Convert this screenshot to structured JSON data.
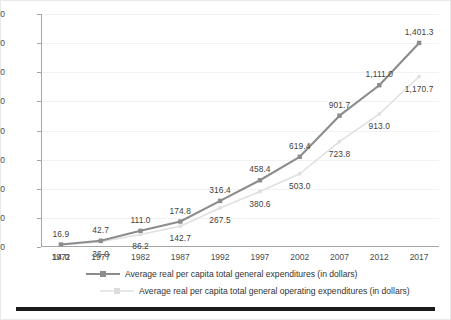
{
  "chart_data": {
    "type": "line",
    "title": "",
    "subtitle": "",
    "xlabel": "",
    "ylabel": "",
    "categories": [
      "1972",
      "1977",
      "1982",
      "1987",
      "1992",
      "1997",
      "2002",
      "2007",
      "2012",
      "2017"
    ],
    "ylim": [
      0,
      1600
    ],
    "ytick_labels": [
      "0",
      "200",
      "400",
      "600",
      "800",
      "1,000",
      "1,200",
      "1,400",
      "1,600"
    ],
    "ytick_values": [
      0,
      200,
      400,
      600,
      800,
      1000,
      1200,
      1400,
      1600
    ],
    "grid": true,
    "legend_position": "bottom",
    "series": [
      {
        "name": "Average real per capita total general expenditures (in dollars)",
        "color": "#8c8c8c",
        "marker": "square",
        "values": [
          16.9,
          42.7,
          111.0,
          174.8,
          316.4,
          458.4,
          619.4,
          901.7,
          1111.0,
          1401.3
        ],
        "labels": [
          "16.9",
          "42.7",
          "111.0",
          "174.8",
          "316.4",
          "458.4",
          "619.4",
          "901.7",
          "1,111.0",
          "1,401.3"
        ]
      },
      {
        "name": "Average real per capita total general operating expenditures (in dollars)",
        "color": "#e0e0e0",
        "marker": "square",
        "values": [
          14.0,
          36.0,
          86.2,
          142.7,
          267.5,
          380.6,
          503.0,
          723.8,
          913.0,
          1170.7
        ],
        "labels": [
          "14.0",
          "36.0",
          "86.2",
          "142.7",
          "267.5",
          "380.6",
          "503.0",
          "723.8",
          "913.0",
          "1,170.7"
        ]
      }
    ]
  },
  "legend": {
    "items": [
      {
        "label": "Average real per capita total general expenditures (in dollars)"
      },
      {
        "label": "Average real per capita total general operating expenditures (in dollars)"
      }
    ]
  },
  "colors": {
    "series_primary": "#8c8c8c",
    "series_secondary": "#e0e0e0",
    "axis": "#a6a6a6",
    "grid": "#f2f2f2",
    "text": "#4d4d4d",
    "rule": "#1a1a1a"
  }
}
